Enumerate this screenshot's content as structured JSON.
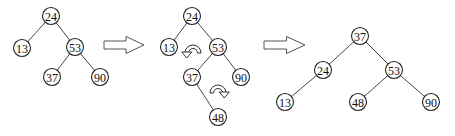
{
  "diagram": {
    "title": "",
    "node_radius": 8.5,
    "colors": {
      "stroke": "#222222",
      "fill": "#ffffff",
      "text": "#111111",
      "arrow": "#555555"
    },
    "trees": [
      {
        "name": "before-insert",
        "nodes": [
          {
            "id": "a24",
            "label": "24",
            "x": 51,
            "y": 16
          },
          {
            "id": "a13",
            "label": "13",
            "x": 22,
            "y": 48
          },
          {
            "id": "a53",
            "label": "53",
            "x": 75,
            "y": 47
          },
          {
            "id": "a37",
            "label": "37",
            "x": 52,
            "y": 77
          },
          {
            "id": "a90",
            "label": "90",
            "x": 100,
            "y": 77
          }
        ],
        "edges": [
          [
            "a24",
            "a13"
          ],
          [
            "a24",
            "a53"
          ],
          [
            "a53",
            "a37"
          ],
          [
            "a53",
            "a90"
          ]
        ]
      },
      {
        "name": "after-insert-48",
        "nodes": [
          {
            "id": "b24",
            "label": "24",
            "x": 192,
            "y": 16
          },
          {
            "id": "b13",
            "label": "13",
            "x": 169,
            "y": 47
          },
          {
            "id": "b53",
            "label": "53",
            "x": 218,
            "y": 47
          },
          {
            "id": "b37",
            "label": "37",
            "x": 192,
            "y": 77
          },
          {
            "id": "b90",
            "label": "90",
            "x": 241,
            "y": 77
          },
          {
            "id": "b48",
            "label": "48",
            "x": 218,
            "y": 117
          }
        ],
        "edges": [
          [
            "b24",
            "b13"
          ],
          [
            "b24",
            "b53"
          ],
          [
            "b53",
            "b37"
          ],
          [
            "b53",
            "b90"
          ],
          [
            "b37",
            "b48"
          ]
        ]
      },
      {
        "name": "after-rotation",
        "nodes": [
          {
            "id": "c37",
            "label": "37",
            "x": 360,
            "y": 36
          },
          {
            "id": "c24",
            "label": "24",
            "x": 323,
            "y": 70
          },
          {
            "id": "c53",
            "label": "53",
            "x": 394,
            "y": 70
          },
          {
            "id": "c13",
            "label": "13",
            "x": 285,
            "y": 102
          },
          {
            "id": "c48",
            "label": "48",
            "x": 358,
            "y": 102
          },
          {
            "id": "c90",
            "label": "90",
            "x": 431,
            "y": 102
          }
        ],
        "edges": [
          [
            "c37",
            "c24"
          ],
          [
            "c37",
            "c53"
          ],
          [
            "c24",
            "c13"
          ],
          [
            "c53",
            "c48"
          ],
          [
            "c53",
            "c90"
          ]
        ]
      }
    ],
    "transition_arrows": [
      {
        "name": "transition-arrow-1",
        "x": 104,
        "y": 45,
        "length": 40
      },
      {
        "name": "transition-arrow-2",
        "x": 264,
        "y": 45,
        "length": 41
      }
    ],
    "rotation_arrows": [
      {
        "name": "rotation-arrow-left",
        "cx": 193,
        "cy": 49,
        "direction": "counterclockwise"
      },
      {
        "name": "rotation-arrow-right",
        "cx": 218,
        "cy": 89,
        "direction": "clockwise"
      }
    ]
  }
}
